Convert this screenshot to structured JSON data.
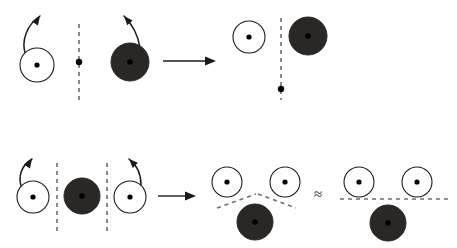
{
  "figure": {
    "width": 457,
    "height": 248,
    "background": "#ffffff",
    "colors": {
      "stroke": "#1a1a1a",
      "open_circle_fill": "#ffffff",
      "filled_circle_fill": "#2b2724",
      "dot": "#000000",
      "dashed_line": "#6e6e6e"
    },
    "approx_symbol": "≈",
    "arrow_glyph": "→"
  },
  "rows": [
    {
      "name": "top-row",
      "left_group": {
        "name": "top-left-group",
        "open_circles": [
          {
            "id": "top-left-open-circle",
            "cx": 37,
            "cy": 65,
            "r": 17,
            "dot_r": 2.6,
            "spin": "counterclockwise"
          }
        ],
        "filled_circles": [
          {
            "id": "top-left-filled-circle",
            "cx": 130,
            "cy": 62,
            "r": 19,
            "dot_r": 2.8,
            "spin": "counterclockwise"
          }
        ],
        "dashed_lines": [
          {
            "id": "top-left-axis",
            "x1": 79,
            "y1": 24,
            "x2": 79,
            "y2": 100
          }
        ],
        "axis_dots": [
          {
            "id": "top-left-axis-dot",
            "cx": 79,
            "cy": 62,
            "r": 3.2
          }
        ],
        "spin_arrows": [
          {
            "id": "top-left-spin-arrow",
            "path": "M 26 56 C 20 40 28 24 40 16",
            "head_x": 40,
            "head_y": 16,
            "head_angle": -56
          },
          {
            "id": "top-left-filled-spin-arrow",
            "path": "M 140 48 C 138 34 132 24 124 16",
            "head_x": 124,
            "head_y": 16,
            "head_angle": -131
          }
        ]
      },
      "transition_arrow": {
        "id": "top-transition-arrow",
        "x1": 163,
        "y1": 61,
        "x2": 216,
        "y2": 61
      },
      "right_group": {
        "name": "top-right-group",
        "open_circles": [
          {
            "id": "top-right-open-circle",
            "cx": 249,
            "cy": 37,
            "r": 16,
            "dot_r": 2.6
          }
        ],
        "filled_circles": [
          {
            "id": "top-right-filled-circle",
            "cx": 308,
            "cy": 36,
            "r": 19,
            "dot_r": 2.8
          }
        ],
        "dashed_lines": [
          {
            "id": "top-right-axis",
            "x1": 281,
            "y1": 18,
            "x2": 281,
            "y2": 100
          }
        ],
        "axis_dots": [
          {
            "id": "top-right-axis-dot",
            "cx": 281,
            "cy": 89,
            "r": 3.2
          }
        ],
        "spin_arrows": []
      }
    },
    {
      "name": "bottom-row",
      "left_group": {
        "name": "bottom-left-group",
        "open_circles": [
          {
            "id": "bottom-left-open-circle-1",
            "cx": 33,
            "cy": 197,
            "r": 16,
            "dot_r": 2.6,
            "spin": "counterclockwise"
          },
          {
            "id": "bottom-left-open-circle-2",
            "cx": 130,
            "cy": 197,
            "r": 16,
            "dot_r": 2.6,
            "spin": "counterclockwise"
          }
        ],
        "filled_circles": [
          {
            "id": "bottom-left-filled-circle",
            "cx": 82,
            "cy": 196,
            "r": 18,
            "dot_r": 2.8
          }
        ],
        "dashed_lines": [
          {
            "id": "bottom-left-axis-1",
            "x1": 57,
            "y1": 163,
            "x2": 57,
            "y2": 232
          },
          {
            "id": "bottom-left-axis-2",
            "x1": 107,
            "y1": 163,
            "x2": 107,
            "y2": 232
          }
        ],
        "axis_dots": [],
        "spin_arrows": [
          {
            "id": "bottom-left-spin-arrow-1",
            "path": "M 22 189 C 17 176 22 165 32 159",
            "head_x": 32,
            "head_y": 159,
            "head_angle": -56
          },
          {
            "id": "bottom-left-spin-arrow-2",
            "path": "M 141 185 C 141 173 137 165 129 159",
            "head_x": 129,
            "head_y": 159,
            "head_angle": -135
          }
        ]
      },
      "transition_arrow": {
        "id": "bottom-transition-arrow",
        "x1": 158,
        "y1": 196,
        "x2": 196,
        "y2": 196
      },
      "middle_group": {
        "name": "bottom-middle-group",
        "open_circles": [
          {
            "id": "bottom-middle-open-circle-1",
            "cx": 227,
            "cy": 182,
            "r": 15,
            "dot_r": 2.6
          },
          {
            "id": "bottom-middle-open-circle-2",
            "cx": 285,
            "cy": 182,
            "r": 15,
            "dot_r": 2.6
          }
        ],
        "filled_circles": [
          {
            "id": "bottom-middle-filled-circle",
            "cx": 255,
            "cy": 222,
            "r": 18,
            "dot_r": 2.8
          }
        ],
        "dashed_lines": [
          {
            "id": "bottom-middle-axis-left",
            "x1": 217,
            "y1": 208,
            "x2": 256,
            "y2": 194
          },
          {
            "id": "bottom-middle-axis-right",
            "x1": 258,
            "y1": 194,
            "x2": 296,
            "y2": 208
          }
        ],
        "axis_dots": [],
        "spin_arrows": []
      },
      "approx": {
        "id": "approx-symbol",
        "x": 318,
        "y": 199,
        "label": "≈"
      },
      "right_group": {
        "name": "bottom-right-group",
        "open_circles": [
          {
            "id": "bottom-right-open-circle-1",
            "cx": 359,
            "cy": 182,
            "r": 15,
            "dot_r": 2.6
          },
          {
            "id": "bottom-right-open-circle-2",
            "cx": 417,
            "cy": 182,
            "r": 15,
            "dot_r": 2.6
          }
        ],
        "filled_circles": [
          {
            "id": "bottom-right-filled-circle",
            "cx": 388,
            "cy": 223,
            "r": 18,
            "dot_r": 2.8
          }
        ],
        "dashed_lines": [
          {
            "id": "bottom-right-axis",
            "x1": 340,
            "y1": 199,
            "x2": 450,
            "y2": 199
          }
        ],
        "axis_dots": [],
        "spin_arrows": []
      }
    }
  ]
}
